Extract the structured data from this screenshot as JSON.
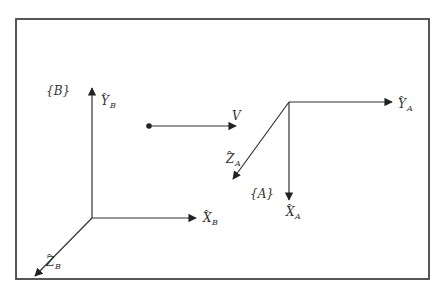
{
  "diagram": {
    "frame_B": {
      "label": "{B}",
      "origin": [
        92,
        218
      ],
      "axes": {
        "Y": {
          "hat": "Y",
          "sub": "B"
        },
        "X": {
          "hat": "X",
          "sub": "B"
        },
        "Z": {
          "hat": "Z",
          "sub": "B"
        }
      }
    },
    "frame_A": {
      "label": "{A}",
      "origin": [
        289,
        101
      ],
      "axes": {
        "Y": {
          "hat": "Y",
          "sub": "A"
        },
        "X": {
          "hat": "X",
          "sub": "A"
        },
        "Z": {
          "hat": "Z",
          "sub": "A"
        }
      }
    },
    "velocity": {
      "label": "V"
    },
    "colors": {
      "stroke": "#333333",
      "frame": "#444444",
      "background": "#ffffff"
    }
  }
}
